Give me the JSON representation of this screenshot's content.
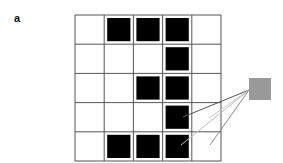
{
  "panel_label": "a",
  "grid": {
    "rows": 5,
    "cols": 5,
    "left": 75,
    "top": 15,
    "cell": 29.2,
    "line_color": "#555555",
    "filled_color": "#000000",
    "filled": [
      [
        0,
        1,
        1,
        1,
        0
      ],
      [
        0,
        0,
        0,
        1,
        0
      ],
      [
        0,
        0,
        1,
        1,
        0
      ],
      [
        0,
        0,
        0,
        1,
        0
      ],
      [
        0,
        1,
        1,
        1,
        0
      ]
    ]
  },
  "output_node": {
    "x": 249,
    "y": 78,
    "size": 22,
    "color": "#999999"
  },
  "connections": [
    {
      "x1": 249,
      "y1": 90,
      "x2": 183,
      "y2": 117,
      "color": "#555555"
    },
    {
      "x1": 249,
      "y1": 90,
      "x2": 209,
      "y2": 118,
      "color": "#c8c8c8"
    },
    {
      "x1": 249,
      "y1": 90,
      "x2": 181,
      "y2": 145,
      "color": "#bbbbbb"
    },
    {
      "x1": 249,
      "y1": 90,
      "x2": 210,
      "y2": 145,
      "color": "#888888"
    }
  ]
}
